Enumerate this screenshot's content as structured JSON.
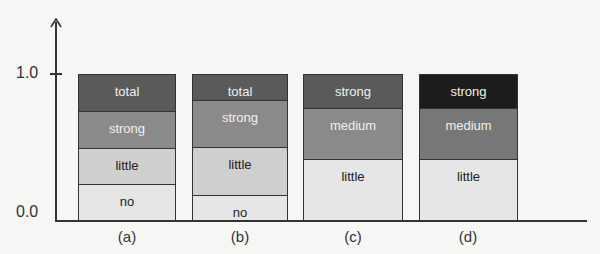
{
  "chart_data": {
    "type": "bar",
    "stacked": true,
    "title": "",
    "xlabel": "",
    "ylabel": "",
    "ylim": [
      0,
      1.0
    ],
    "y_ticks": [
      "0.0",
      "1.0"
    ],
    "grid": false,
    "legend": "none (segment labels inside bars)",
    "categories": [
      "(a)",
      "(b)",
      "(c)",
      "(d)"
    ],
    "bars": [
      {
        "label": "(a)",
        "segments": [
          {
            "name": "no",
            "value": 0.25,
            "color": "#e6e6e6",
            "text_color": "#222222"
          },
          {
            "name": "little",
            "value": 0.25,
            "color": "#cfcfcf",
            "text_color": "#222222"
          },
          {
            "name": "strong",
            "value": 0.25,
            "color": "#8a8a8a",
            "text_color": "#f0f0f0"
          },
          {
            "name": "total",
            "value": 0.25,
            "color": "#5a5a5a",
            "text_color": "#f0f0f0"
          }
        ]
      },
      {
        "label": "(b)",
        "segments": [
          {
            "name": "no",
            "value": 0.17,
            "color": "#e6e6e6",
            "text_color": "#222222"
          },
          {
            "name": "little",
            "value": 0.33,
            "color": "#cfcfcf",
            "text_color": "#222222"
          },
          {
            "name": "strong",
            "value": 0.33,
            "color": "#8a8a8a",
            "text_color": "#f0f0f0"
          },
          {
            "name": "total",
            "value": 0.17,
            "color": "#5a5a5a",
            "text_color": "#f0f0f0"
          }
        ]
      },
      {
        "label": "(c)",
        "segments": [
          {
            "name": "little",
            "value": 0.42,
            "color": "#e6e6e6",
            "text_color": "#222222"
          },
          {
            "name": "medium",
            "value": 0.35,
            "color": "#8a8a8a",
            "text_color": "#f0f0f0"
          },
          {
            "name": "strong",
            "value": 0.23,
            "color": "#5a5a5a",
            "text_color": "#f0f0f0"
          }
        ]
      },
      {
        "label": "(d)",
        "segments": [
          {
            "name": "little",
            "value": 0.42,
            "color": "#e6e6e6",
            "text_color": "#222222"
          },
          {
            "name": "medium",
            "value": 0.35,
            "color": "#777777",
            "text_color": "#f0f0f0"
          },
          {
            "name": "strong",
            "value": 0.23,
            "color": "#1c1c1c",
            "text_color": "#f0f0f0"
          }
        ]
      }
    ]
  },
  "axis": {
    "y_top_label": "1.0",
    "y_bottom_label": "0.0"
  },
  "bar_labels": [
    "(a)",
    "(b)",
    "(c)",
    "(d)"
  ]
}
